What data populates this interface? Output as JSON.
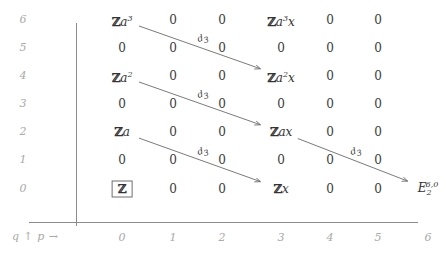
{
  "chart_data": {
    "type": "table",
    "title": "",
    "xlabel": "p",
    "ylabel": "q",
    "axis_legend": "q ↑   p →",
    "xticks": [
      "0",
      "1",
      "2",
      "3",
      "4",
      "5",
      "6"
    ],
    "yticks": [
      "6",
      "5",
      "4",
      "3",
      "2",
      "1",
      "0"
    ],
    "xlim": [
      0,
      6
    ],
    "ylim": [
      0,
      6
    ],
    "grid": false,
    "legend": "none",
    "cells": [
      {
        "p": 0,
        "q": 6,
        "text": "Za3",
        "html": "<span class='bb'>ℤ</span><span class='ital'>a</span><sup>3</sup>"
      },
      {
        "p": 1,
        "q": 6,
        "text": "0",
        "html": "0"
      },
      {
        "p": 2,
        "q": 6,
        "text": "0",
        "html": "0"
      },
      {
        "p": 3,
        "q": 6,
        "text": "Za3x",
        "html": "<span class='bb'>ℤ</span><span class='ital'>a</span><sup>3</sup><span class='ital'>x</span>"
      },
      {
        "p": 4,
        "q": 6,
        "text": "0",
        "html": "0"
      },
      {
        "p": 5,
        "q": 6,
        "text": "0",
        "html": "0"
      },
      {
        "p": 0,
        "q": 5,
        "text": "0",
        "html": "0"
      },
      {
        "p": 1,
        "q": 5,
        "text": "0",
        "html": "0"
      },
      {
        "p": 2,
        "q": 5,
        "text": "0",
        "html": "0"
      },
      {
        "p": 3,
        "q": 5,
        "text": "0",
        "html": "0"
      },
      {
        "p": 4,
        "q": 5,
        "text": "0",
        "html": "0"
      },
      {
        "p": 5,
        "q": 5,
        "text": "0",
        "html": "0"
      },
      {
        "p": 0,
        "q": 4,
        "text": "Za2",
        "html": "<span class='bb'>ℤ</span><span class='ital'>a</span><sup>2</sup>"
      },
      {
        "p": 1,
        "q": 4,
        "text": "0",
        "html": "0"
      },
      {
        "p": 2,
        "q": 4,
        "text": "0",
        "html": "0"
      },
      {
        "p": 3,
        "q": 4,
        "text": "Za2x",
        "html": "<span class='bb'>ℤ</span><span class='ital'>a</span><sup>2</sup><span class='ital'>x</span>"
      },
      {
        "p": 4,
        "q": 4,
        "text": "0",
        "html": "0"
      },
      {
        "p": 5,
        "q": 4,
        "text": "0",
        "html": "0"
      },
      {
        "p": 0,
        "q": 3,
        "text": "0",
        "html": "0"
      },
      {
        "p": 1,
        "q": 3,
        "text": "0",
        "html": "0"
      },
      {
        "p": 2,
        "q": 3,
        "text": "0",
        "html": "0"
      },
      {
        "p": 3,
        "q": 3,
        "text": "0",
        "html": "0"
      },
      {
        "p": 4,
        "q": 3,
        "text": "0",
        "html": "0"
      },
      {
        "p": 5,
        "q": 3,
        "text": "0",
        "html": "0"
      },
      {
        "p": 0,
        "q": 2,
        "text": "Za",
        "html": "<span class='bb'>ℤ</span><span class='ital'>a</span>"
      },
      {
        "p": 1,
        "q": 2,
        "text": "0",
        "html": "0"
      },
      {
        "p": 2,
        "q": 2,
        "text": "0",
        "html": "0"
      },
      {
        "p": 3,
        "q": 2,
        "text": "Zax",
        "html": "<span class='bb'>ℤ</span><span class='ital'>ax</span>"
      },
      {
        "p": 4,
        "q": 2,
        "text": "0",
        "html": "0"
      },
      {
        "p": 5,
        "q": 2,
        "text": "0",
        "html": "0"
      },
      {
        "p": 0,
        "q": 1,
        "text": "0",
        "html": "0"
      },
      {
        "p": 1,
        "q": 1,
        "text": "0",
        "html": "0"
      },
      {
        "p": 2,
        "q": 1,
        "text": "0",
        "html": "0"
      },
      {
        "p": 3,
        "q": 1,
        "text": "0",
        "html": "0"
      },
      {
        "p": 4,
        "q": 1,
        "text": "0",
        "html": "0"
      },
      {
        "p": 5,
        "q": 1,
        "text": "0",
        "html": "0"
      },
      {
        "p": 0,
        "q": 0,
        "text": "Z",
        "boxed": true,
        "html": "<span class='boxed'><span class='bb'>ℤ</span></span>"
      },
      {
        "p": 1,
        "q": 0,
        "text": "0",
        "html": "0"
      },
      {
        "p": 2,
        "q": 0,
        "text": "0",
        "html": "0"
      },
      {
        "p": 3,
        "q": 0,
        "text": "Zx",
        "html": "<span class='bb'>ℤ</span><span class='ital'>x</span>"
      },
      {
        "p": 4,
        "q": 0,
        "text": "0",
        "html": "0"
      },
      {
        "p": 5,
        "q": 0,
        "text": "0",
        "html": "0"
      },
      {
        "p": 6,
        "q": 0,
        "text": "E2^6,0",
        "html": "<span class='ital'>E</span><sub>2</sub><sup style='margin-left:-6px'>6,0</sup>"
      }
    ],
    "differentials": [
      {
        "label": "d3",
        "label_html": "<span class='ital'>d</span><sub>3</sub>",
        "from_p": 0,
        "from_q": 6,
        "to_p": 3,
        "to_q": 4
      },
      {
        "label": "d3",
        "label_html": "<span class='ital'>d</span><sub>3</sub>",
        "from_p": 0,
        "from_q": 4,
        "to_p": 3,
        "to_q": 2
      },
      {
        "label": "d3",
        "label_html": "<span class='ital'>d</span><sub>3</sub>",
        "from_p": 0,
        "from_q": 2,
        "to_p": 3,
        "to_q": 0
      },
      {
        "label": "d3",
        "label_html": "<span class='ital'>d</span><sub>3</sub>",
        "from_p": 3,
        "from_q": 2,
        "to_p": 6,
        "to_q": 0
      }
    ],
    "colors": {
      "text": "#333333",
      "axis": "#8c8c8c",
      "tick": "#a9a9a9",
      "arrow": "#6b6b6b",
      "background": "#ffffff"
    }
  }
}
